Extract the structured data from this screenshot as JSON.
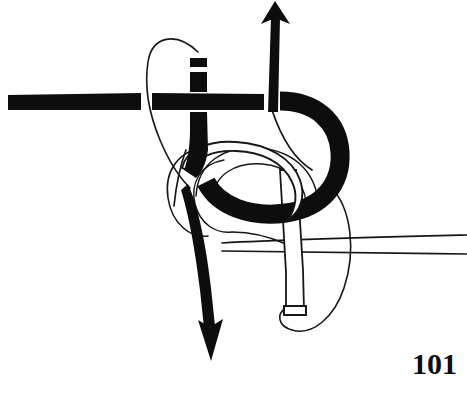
{
  "figure": {
    "number_label": "101",
    "caption": "",
    "canvas": {
      "width": 467,
      "height": 393
    },
    "background_color": "#ffffff",
    "ink_color": "#0d0d0d",
    "strap_fill_color": "#0d0d0d",
    "band_fill_color": "#ffffff",
    "outline_color": "#171717"
  },
  "elements": {
    "horizontal_strap": {
      "name": "horizontal black strap",
      "description": "thick solid black horizontal band crossing the figure from the left edge toward the centre, interrupted by two white over-crossing gaps",
      "color": "#0d0d0d"
    },
    "vertical_strap": {
      "name": "vertical black strap",
      "description": "thick solid black vertical band rising from the knot centre, with a white gap near its squared top end and a white gap at the horizontal crossing",
      "color": "#0d0d0d"
    },
    "thick_curve": {
      "name": "thick black curved strap",
      "description": "heavy black band sweeping right from the horizontal strap, round the bight and back to the left under the white band",
      "color": "#0d0d0d"
    },
    "white_band_upper": {
      "name": "white outlined band",
      "description": "white band with thin black outline arching over the thick black bight from lower-left to lower-right",
      "color": "#ffffff"
    },
    "white_band_lower": {
      "name": "white outlined tail",
      "description": "white outlined band descending from the bight to a squared cut end at the lower centre-right",
      "color": "#ffffff"
    },
    "thin_loop_upper": {
      "name": "thin rope loop upper",
      "description": "narrow hairline loop encircling the vertical black strap above the crossing",
      "color": "#171717"
    },
    "thin_loop_lower_left": {
      "name": "thin rope loop lower left",
      "description": "hairline loops curling at the lower left of the knot centre",
      "color": "#171717"
    },
    "thin_loop_lower_right": {
      "name": "thin rope loop lower right",
      "description": "hairline loop encircling the white tail and running off to the right edge as two parallel lines",
      "color": "#171717"
    },
    "arrow_up": {
      "name": "upward direction arrow",
      "description": "tapered black arrow pointing up out of the top of the figure",
      "direction": "up",
      "color": "#0d0d0d"
    },
    "arrow_down": {
      "name": "downward direction arrow",
      "description": "tapered black arrow curving down out of the bottom of the knot centre",
      "direction": "down",
      "color": "#0d0d0d"
    }
  }
}
